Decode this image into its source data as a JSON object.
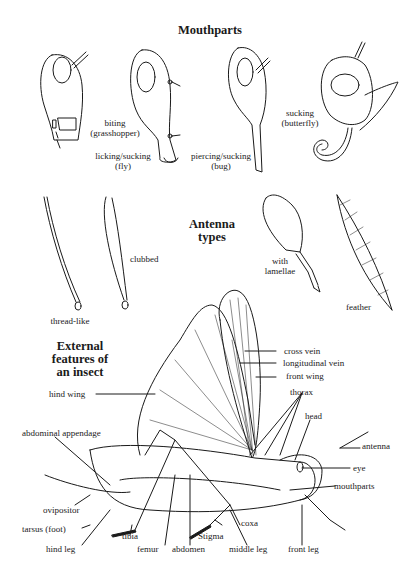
{
  "mouthparts": {
    "title": "Mouthparts",
    "items": [
      {
        "line1": "biting",
        "line2": "(grasshopper)"
      },
      {
        "line1": "licking/sucking",
        "line2": "(fly)"
      },
      {
        "line1": "piercing/sucking",
        "line2": "(bug)"
      },
      {
        "line1": "sucking",
        "line2": "(butterfly)"
      }
    ]
  },
  "antenna": {
    "title_line1": "Antenna",
    "title_line2": "types",
    "items": [
      {
        "label": "thread-like"
      },
      {
        "label": "clubbed"
      },
      {
        "line1": "with",
        "line2": "lamellae"
      },
      {
        "label": "feather"
      }
    ]
  },
  "insect": {
    "title_line1": "External",
    "title_line2": "features of",
    "title_line3": "an insect",
    "labels": {
      "hind_wing": "hind wing",
      "cross_vein": "cross vein",
      "longitudinal_vein": "longitudinal vein",
      "front_wing": "front wing",
      "thorax": "thorax",
      "head": "head",
      "antenna": "antenna",
      "eye": "eye",
      "mouthparts": "mouthparts",
      "abdominal_appendage": "abdominal appendage",
      "ovipositor": "ovipositor",
      "tarsus": "tarsus (foot)",
      "hind_leg": "hind leg",
      "tibia": "tibia",
      "femur": "femur",
      "abdomen": "abdomen",
      "stigma": "Stigma",
      "coxa": "coxa",
      "middle_leg": "middle leg",
      "front_leg": "front leg"
    }
  }
}
